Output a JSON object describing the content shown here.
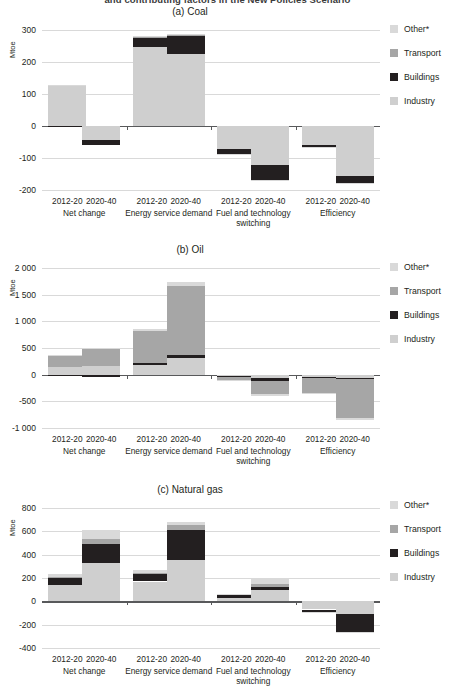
{
  "figure": {
    "suptitle": "and contributing factors in the New Policies Scenario",
    "ylabel": "Mtoe",
    "legend": [
      {
        "label": "Other*",
        "color": "#d9d9d9"
      },
      {
        "label": "Transport",
        "color": "#a6a6a6"
      },
      {
        "label": "Buildings",
        "color": "#231f20"
      },
      {
        "label": "Industry",
        "color": "#cfcfcf"
      }
    ],
    "group_labels": [
      "Net change",
      "Energy service demand",
      "Fuel and technology switching",
      "Efficiency"
    ],
    "period_labels": [
      "2012-20",
      "2020-40"
    ]
  },
  "chart_data": [
    {
      "type": "bar",
      "title": "(a) Coal",
      "ylabel": "Mtoe",
      "xlabel": "",
      "ylim": [
        -200,
        300
      ],
      "yticks": [
        300,
        200,
        100,
        0,
        -100,
        -200
      ],
      "ytick_labels": [
        "300",
        "200",
        "100",
        "0",
        "-100",
        "-200"
      ],
      "grid": true,
      "legend_position": "right",
      "stacked": true,
      "categories": [
        "Net change 2012-20",
        "Net change 2020-40",
        "Energy service demand 2012-20",
        "Energy service demand 2020-40",
        "Fuel and technology switching 2012-20",
        "Fuel and technology switching 2020-40",
        "Efficiency 2012-20",
        "Efficiency 2020-40"
      ],
      "series": [
        {
          "name": "Industry",
          "values": [
            126,
            -44,
            246,
            225,
            -72,
            -122,
            -60,
            -155
          ]
        },
        {
          "name": "Buildings",
          "values": [
            -4,
            -15,
            30,
            57,
            -14,
            -46,
            -6,
            -24
          ]
        },
        {
          "name": "Transport",
          "values": [
            0,
            0,
            2,
            2,
            0,
            0,
            0,
            0
          ]
        },
        {
          "name": "Other*",
          "values": [
            2,
            0,
            3,
            2,
            -1,
            -2,
            -1,
            -2
          ]
        }
      ]
    },
    {
      "type": "bar",
      "title": "(b) Oil",
      "ylabel": "Mtoe",
      "xlabel": "",
      "ylim": [
        -1000,
        2000
      ],
      "yticks": [
        2000,
        1500,
        1000,
        500,
        0,
        -500,
        -1000
      ],
      "ytick_labels": [
        "2 000",
        "1 500",
        "1 000",
        "500",
        "0",
        "-500",
        "-1 000"
      ],
      "grid": true,
      "legend_position": "right",
      "stacked": true,
      "categories": [
        "Net change 2012-20",
        "Net change 2020-40",
        "Energy service demand 2012-20",
        "Energy service demand 2020-40",
        "Fuel and technology switching 2012-20",
        "Fuel and technology switching 2020-40",
        "Efficiency 2012-20",
        "Efficiency 2020-40"
      ],
      "series": [
        {
          "name": "Industry",
          "values": [
            150,
            165,
            190,
            310,
            -20,
            -60,
            -40,
            -60
          ]
        },
        {
          "name": "Buildings",
          "values": [
            -10,
            -40,
            25,
            60,
            -15,
            -50,
            -15,
            -30
          ]
        },
        {
          "name": "Transport",
          "values": [
            200,
            320,
            600,
            1290,
            -70,
            -250,
            -280,
            -720
          ]
        },
        {
          "name": "Other*",
          "values": [
            10,
            15,
            35,
            80,
            -10,
            -40,
            -25,
            -40
          ]
        }
      ]
    },
    {
      "type": "bar",
      "title": "(c) Natural gas",
      "ylabel": "Mtoe",
      "xlabel": "",
      "ylim": [
        -400,
        800
      ],
      "yticks": [
        800,
        600,
        400,
        200,
        0,
        -200,
        -400
      ],
      "ytick_labels": [
        "800",
        "600",
        "400",
        "200",
        "0",
        "-200",
        "-400"
      ],
      "grid": true,
      "legend_position": "right",
      "stacked": true,
      "categories": [
        "Net change 2012-20",
        "Net change 2020-40",
        "Energy service demand 2012-20",
        "Energy service demand 2020-40",
        "Fuel and technology switching 2012-20",
        "Fuel and technology switching 2020-40",
        "Efficiency 2012-20",
        "Efficiency 2020-40"
      ],
      "series": [
        {
          "name": "Industry",
          "values": [
            142,
            330,
            170,
            355,
            32,
            98,
            -70,
            -110
          ]
        },
        {
          "name": "Buildings",
          "values": [
            62,
            165,
            62,
            255,
            28,
            28,
            -22,
            -150
          ]
        },
        {
          "name": "Transport",
          "values": [
            8,
            40,
            12,
            45,
            0,
            20,
            0,
            -5
          ]
        },
        {
          "name": "Other*",
          "values": [
            20,
            75,
            27,
            25,
            5,
            52,
            -12,
            -8
          ]
        }
      ]
    }
  ]
}
